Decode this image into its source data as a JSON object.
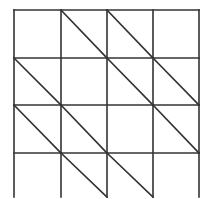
{
  "diagram": {
    "type": "grid-with-diagonals",
    "rows": 4,
    "cols": 4,
    "line_color": "#333333",
    "background": "#ffffff",
    "x_lines": [
      14,
      61,
      107,
      153,
      199
    ],
    "y_lines": [
      10,
      58,
      105,
      153,
      197
    ],
    "bottom_border": false,
    "diagonal_direction": "top-left-to-bottom-right",
    "diagonal_cells": [
      {
        "row": 1,
        "col": 2
      },
      {
        "row": 1,
        "col": 3
      },
      {
        "row": 2,
        "col": 1
      },
      {
        "row": 2,
        "col": 3
      },
      {
        "row": 2,
        "col": 4
      },
      {
        "row": 3,
        "col": 1
      },
      {
        "row": 3,
        "col": 2
      },
      {
        "row": 3,
        "col": 4
      },
      {
        "row": 4,
        "col": 2
      },
      {
        "row": 4,
        "col": 3
      }
    ]
  }
}
